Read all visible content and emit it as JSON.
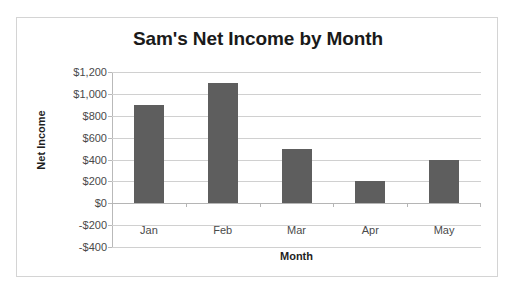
{
  "chart_data": {
    "type": "bar",
    "title": "Sam's Net Income by Month",
    "xlabel": "Month",
    "ylabel": "Net Income",
    "categories": [
      "Jan",
      "Feb",
      "Mar",
      "Apr",
      "May"
    ],
    "values": [
      900,
      1100,
      500,
      200,
      400
    ],
    "ylim": [
      -400,
      1200
    ],
    "ytick_step": 200,
    "ytick_labels": [
      "$1,200",
      "$1,000",
      "$800",
      "$600",
      "$400",
      "$200",
      "$0",
      "-$200",
      "-$400"
    ],
    "ytick_values": [
      1200,
      1000,
      800,
      600,
      400,
      200,
      0,
      -200,
      -400
    ],
    "grid": true,
    "legend": false,
    "bar_color": "#5e5e5e",
    "gridline_color": "#d0d0d0",
    "axis_color": "#b9b9b9",
    "plot_background": "#ffffff"
  }
}
